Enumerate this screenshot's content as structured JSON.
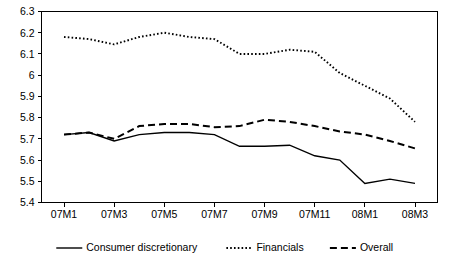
{
  "chart_data": {
    "type": "line",
    "title": "",
    "subtitle": "",
    "xlabel": "",
    "ylabel": "",
    "grid": false,
    "legend_position": "bottom",
    "x": [
      "07M1",
      "07M2",
      "07M3",
      "07M4",
      "07M5",
      "07M6",
      "07M7",
      "07M8",
      "07M9",
      "07M10",
      "07M11",
      "07M12",
      "08M1",
      "08M2",
      "08M3"
    ],
    "xticklabels": [
      "07M1",
      "07M3",
      "07M5",
      "07M7",
      "07M9",
      "07M11",
      "08M1",
      "08M3"
    ],
    "xtick_values": [
      "07M1",
      "07M3",
      "07M5",
      "07M7",
      "07M9",
      "07M11",
      "08M1",
      "08M3"
    ],
    "yticklabels": [
      "5.4",
      "5.5",
      "5.6",
      "5.7",
      "5.8",
      "5.9",
      "6",
      "6.1",
      "6.2",
      "6.3"
    ],
    "ytick_values": [
      5.4,
      5.5,
      5.6,
      5.7,
      5.8,
      5.9,
      6.0,
      6.1,
      6.2,
      6.3
    ],
    "ylim": [
      5.4,
      6.3
    ],
    "xlim": [
      "07M1",
      "08M3"
    ],
    "series": [
      {
        "name": "Consumer discretionary",
        "style": "solid",
        "color": "#000000",
        "values": [
          5.72,
          5.73,
          5.69,
          5.72,
          5.73,
          5.73,
          5.72,
          5.665,
          5.665,
          5.67,
          5.62,
          5.6,
          5.49,
          5.51,
          5.49
        ]
      },
      {
        "name": "Financials",
        "style": "dotted",
        "color": "#000000",
        "values": [
          6.18,
          6.17,
          6.145,
          6.18,
          6.2,
          6.18,
          6.17,
          6.1,
          6.1,
          6.12,
          6.11,
          6.01,
          5.95,
          5.89,
          5.78
        ]
      },
      {
        "name": "Overall",
        "style": "dashed",
        "color": "#000000",
        "values": [
          5.72,
          5.73,
          5.7,
          5.76,
          5.77,
          5.77,
          5.755,
          5.76,
          5.79,
          5.78,
          5.76,
          5.735,
          5.72,
          5.69,
          5.655
        ]
      }
    ],
    "legend": [
      {
        "label": "Consumer discretionary",
        "style": "solid"
      },
      {
        "label": "Financials",
        "style": "dotted"
      },
      {
        "label": "Overall",
        "style": "dashed"
      }
    ]
  }
}
